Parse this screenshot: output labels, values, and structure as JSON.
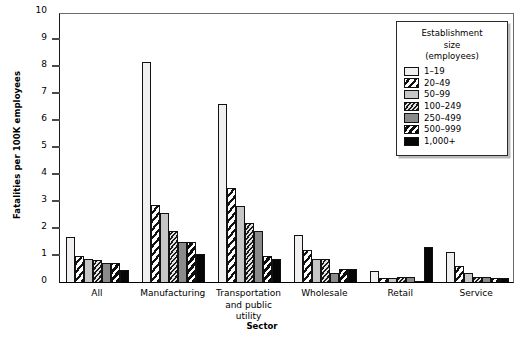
{
  "chart_data": {
    "type": "bar",
    "title": "",
    "xlabel": "Sector",
    "ylabel": "Fatalities per 100K employees",
    "ylim": [
      0,
      10
    ],
    "yticks": [
      0,
      1,
      2,
      3,
      4,
      5,
      6,
      7,
      8,
      9,
      10
    ],
    "grid": false,
    "legend_position": "top-right",
    "legend_title": "Establishment\nsize\n(employees)",
    "categories": [
      "All",
      "Manufacturing",
      "Transportation\nand public\nutility",
      "Wholesale",
      "Retail",
      "Service"
    ],
    "series": [
      {
        "name": "1–19",
        "pattern": "solid-white",
        "color": "#f2f0ee",
        "values": [
          1.65,
          8.15,
          6.6,
          1.75,
          0.4,
          1.1
        ]
      },
      {
        "name": "20–49",
        "pattern": "diagonal-stripe",
        "color": "#111111",
        "values": [
          0.95,
          2.85,
          3.5,
          1.2,
          0.15,
          0.6
        ]
      },
      {
        "name": "50–99",
        "pattern": "solid-light-gray",
        "color": "#c6c6c6",
        "values": [
          0.85,
          2.55,
          2.8,
          0.85,
          0.15,
          0.35
        ]
      },
      {
        "name": "100–249",
        "pattern": "dense-hatch",
        "color": "#1a1a1a",
        "values": [
          0.8,
          1.9,
          2.2,
          0.85,
          0.2,
          0.2
        ]
      },
      {
        "name": "250–499",
        "pattern": "solid-medium-gray",
        "color": "#8a8a8a",
        "values": [
          0.7,
          1.5,
          1.9,
          0.35,
          0.2,
          0.2
        ]
      },
      {
        "name": "500–999",
        "pattern": "bold-diagonal",
        "color": "#0d0d0d",
        "values": [
          0.7,
          1.5,
          0.95,
          0.5,
          0.05,
          0.15
        ]
      },
      {
        "name": "1,000+",
        "pattern": "solid-black",
        "color": "#060606",
        "values": [
          0.45,
          1.05,
          0.85,
          0.5,
          1.3,
          0.15
        ]
      }
    ]
  }
}
